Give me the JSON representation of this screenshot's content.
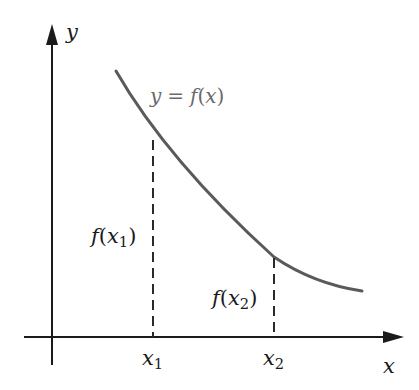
{
  "diagram": {
    "type": "function-graph",
    "colors": {
      "axes": "#1a1a1a",
      "curve": "#5a5a5a",
      "dashed": "#2a2a2a",
      "curve_label": "#6a6a6a",
      "text": "#1a1a1a"
    },
    "axes": {
      "x_label": "x",
      "y_label": "y"
    },
    "curve": {
      "label_lhs": "y",
      "label_eq": "=",
      "label_fn": "f",
      "label_arg": "x"
    },
    "points": [
      {
        "tick_base": "x",
        "tick_sub": "1",
        "value_fn": "f",
        "value_base": "x",
        "value_sub": "1"
      },
      {
        "tick_base": "x",
        "tick_sub": "2",
        "value_fn": "f",
        "value_base": "x",
        "value_sub": "2"
      }
    ],
    "glyphs": {
      "open_paren": "(",
      "close_paren": ")"
    }
  }
}
